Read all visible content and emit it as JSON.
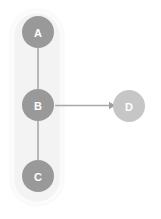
{
  "diagram": {
    "type": "directed-graph",
    "canvas": {
      "width": 161,
      "height": 219,
      "background": "#ffffff"
    },
    "cluster": {
      "name": "node-group-abc",
      "x": 13,
      "y": 12,
      "width": 48,
      "height": 191,
      "radius": 24,
      "fill": "#f3f3f3",
      "border": "#fcfcfc"
    },
    "nodes": [
      {
        "id": "A",
        "label": "A",
        "cx": 38,
        "cy": 32,
        "r": 16,
        "color": "#999999",
        "text_color": "#ffffff",
        "in_cluster": true
      },
      {
        "id": "B",
        "label": "B",
        "cx": 38,
        "cy": 105,
        "r": 16,
        "color": "#999999",
        "text_color": "#ffffff",
        "in_cluster": true
      },
      {
        "id": "C",
        "label": "C",
        "cx": 38,
        "cy": 176,
        "r": 16,
        "color": "#999999",
        "text_color": "#ffffff",
        "in_cluster": true
      },
      {
        "id": "D",
        "label": "D",
        "cx": 129,
        "cy": 106,
        "r": 16,
        "color": "#c6c6c6",
        "text_color": "#ffffff",
        "in_cluster": false
      }
    ],
    "edges": [
      {
        "id": "A-B",
        "from": "A",
        "to": "B",
        "arrow": false,
        "color": "#a8a8a8"
      },
      {
        "id": "B-C",
        "from": "B",
        "to": "C",
        "arrow": false,
        "color": "#a8a8a8"
      },
      {
        "id": "B-D",
        "from": "B",
        "to": "D",
        "arrow": true,
        "color": "#a8a8a8"
      }
    ]
  },
  "labels": {
    "node_a": "A",
    "node_b": "B",
    "node_c": "C",
    "node_d": "D"
  }
}
